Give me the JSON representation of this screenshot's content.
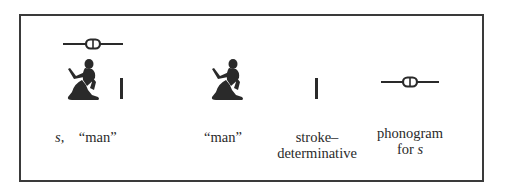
{
  "figure": {
    "groups": [
      {
        "id": "combined",
        "glyphs": [
          "folded-cloth-s-icon",
          "seated-man-icon",
          "stroke-icon"
        ],
        "caption_italic": "s,",
        "caption": "“man”"
      },
      {
        "id": "man",
        "glyphs": [
          "seated-man-icon"
        ],
        "caption": "“man”"
      },
      {
        "id": "stroke",
        "glyphs": [
          "stroke-icon"
        ],
        "caption_line1": "stroke–",
        "caption_line2": "determinative"
      },
      {
        "id": "phonogram",
        "glyphs": [
          "folded-cloth-s-icon"
        ],
        "caption_line1": "phonogram",
        "caption_line2_prefix": "for ",
        "caption_line2_italic": "s"
      }
    ]
  }
}
